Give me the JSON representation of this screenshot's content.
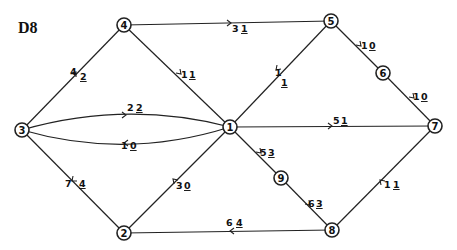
{
  "title": "D8",
  "nodes": [
    {
      "id": "1",
      "x": 230,
      "y": 127
    },
    {
      "id": "2",
      "x": 124,
      "y": 233
    },
    {
      "id": "3",
      "x": 22,
      "y": 130
    },
    {
      "id": "4",
      "x": 124,
      "y": 25
    },
    {
      "id": "5",
      "x": 331,
      "y": 21
    },
    {
      "id": "6",
      "x": 383,
      "y": 73
    },
    {
      "id": "7",
      "x": 435,
      "y": 126
    },
    {
      "id": "8",
      "x": 332,
      "y": 230
    },
    {
      "id": "9",
      "x": 281,
      "y": 178
    }
  ],
  "edges": [
    {
      "from": "3",
      "to": "4",
      "label": "4 2",
      "label_a": "4",
      "label_b": "2"
    },
    {
      "from": "4",
      "to": "5",
      "label": "3 1",
      "label_a": "3",
      "label_b": "1"
    },
    {
      "from": "4",
      "to": "1",
      "label": "1 1",
      "label_a": "1",
      "label_b": "1"
    },
    {
      "from": "5",
      "to": "1",
      "label": "1 1",
      "label_a": "1",
      "label_b": "1"
    },
    {
      "from": "5",
      "to": "6",
      "label": "1 0",
      "label_a": "1",
      "label_b": "0"
    },
    {
      "from": "6",
      "to": "7",
      "label": "1 0",
      "label_a": "1",
      "label_b": "0"
    },
    {
      "from": "3",
      "to": "1",
      "label": "2 2",
      "label_a": "2",
      "label_b": "2"
    },
    {
      "from": "1",
      "to": "3",
      "label": "1 0",
      "label_a": "1",
      "label_b": "0"
    },
    {
      "from": "1",
      "to": "7",
      "label": "5 1",
      "label_a": "5",
      "label_b": "1"
    },
    {
      "from": "1",
      "to": "9",
      "label": "5 3",
      "label_a": "5",
      "label_b": "3"
    },
    {
      "from": "9",
      "to": "8",
      "label": "6 3",
      "label_a": "6",
      "label_b": "3"
    },
    {
      "from": "7",
      "to": "8",
      "label": "1 1",
      "label_a": "1",
      "label_b": "1"
    },
    {
      "from": "8",
      "to": "2",
      "label": "6 4",
      "label_a": "6",
      "label_b": "4"
    },
    {
      "from": "1",
      "to": "2",
      "label": "3 0",
      "label_a": "3",
      "label_b": "0"
    },
    {
      "from": "2",
      "to": "3",
      "label": "7 4",
      "label_a": "7",
      "label_b": "4"
    }
  ]
}
